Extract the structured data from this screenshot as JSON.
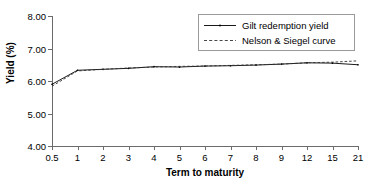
{
  "chart_data": {
    "type": "line",
    "title": "",
    "xlabel": "Term to maturity",
    "ylabel": "Yield (%)",
    "categories": [
      "0.5",
      "1",
      "2",
      "3",
      "4",
      "5",
      "6",
      "7",
      "8",
      "9",
      "12",
      "15",
      "21"
    ],
    "ylim": [
      4.0,
      8.0
    ],
    "yticks": [
      "4.00",
      "5.00",
      "6.00",
      "7.00",
      "8.00"
    ],
    "ytick_values": [
      4.0,
      5.0,
      6.0,
      7.0,
      8.0
    ],
    "grid": false,
    "legend_position": "top-right",
    "series": [
      {
        "name": "Gilt redemption yield",
        "style": "solid",
        "marker": "small-dot",
        "values": [
          5.9,
          6.33,
          6.36,
          6.39,
          6.44,
          6.43,
          6.46,
          6.47,
          6.49,
          6.52,
          6.56,
          6.55,
          6.5
        ]
      },
      {
        "name": "Nelson & Siegel curve",
        "style": "dashed",
        "marker": "none",
        "values": [
          5.84,
          6.31,
          6.36,
          6.4,
          6.43,
          6.45,
          6.46,
          6.48,
          6.5,
          6.52,
          6.56,
          6.58,
          6.62
        ]
      }
    ],
    "colors": {
      "series_1": "#000000",
      "series_2": "#333333",
      "axis": "#6b6b6b",
      "legend_border": "#9a9a9a",
      "background": "#ffffff"
    }
  }
}
